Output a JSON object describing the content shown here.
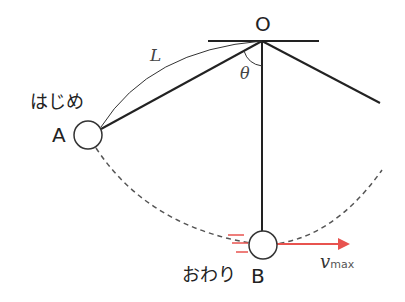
{
  "diagram": {
    "pivot_label": "O",
    "length_label": "L",
    "angle_label": "θ",
    "start_text": "はじめ",
    "start_point": "A",
    "end_text": "おわり",
    "end_point": "B",
    "velocity_symbol": "v",
    "velocity_subscript": "max",
    "colors": {
      "line": "#222222",
      "dashed_path": "#555555",
      "velocity_arrow": "#e8534f",
      "motion_lines": "#e8534f"
    }
  }
}
